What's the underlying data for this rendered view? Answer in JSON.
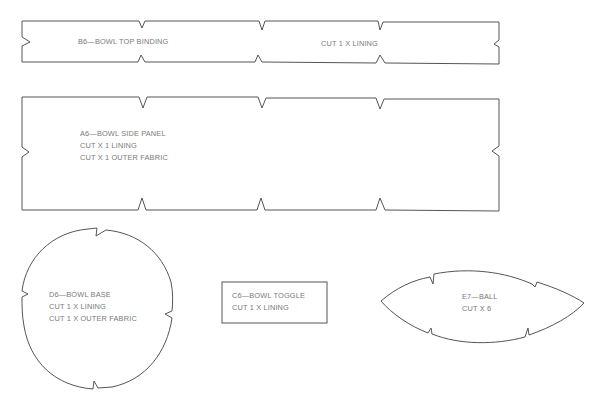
{
  "pieces": [
    {
      "id": "B6",
      "shape": "rectangle-notched",
      "lines": [
        "B6—BOWL TOP BINDING"
      ],
      "secondary_label": "CUT 1 X LINING"
    },
    {
      "id": "A6",
      "shape": "rectangle-notched",
      "lines": [
        "A6—BOWL SIDE PANEL",
        "CUT X 1 LINING",
        "CUT X 1 OUTER FABRIC"
      ]
    },
    {
      "id": "D6",
      "shape": "circle-notched",
      "lines": [
        "D6—BOWL BASE",
        "CUT 1 X LINING",
        "CUT 1 X OUTER FABRIC"
      ]
    },
    {
      "id": "C6",
      "shape": "rectangle",
      "lines": [
        "C6—BOWL TOGGLE",
        "CUT 1 X LINING"
      ]
    },
    {
      "id": "E7",
      "shape": "ellipse-pointed-notched",
      "lines": [
        "E7—BALL",
        "CUT X 6"
      ]
    }
  ],
  "colors": {
    "outline": "#555555",
    "text": "#7a7a7a",
    "background": "#ffffff"
  }
}
